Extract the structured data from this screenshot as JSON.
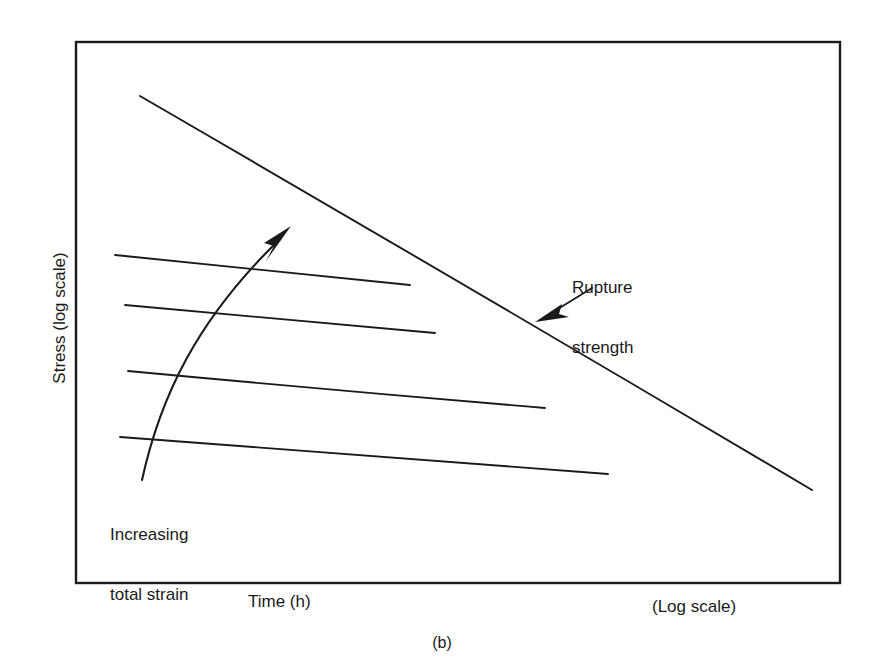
{
  "figure": {
    "caption": "(b)",
    "background_color": "#ffffff",
    "ink_color": "#1a1a1a"
  },
  "axes": {
    "y_label": "Stress (log scale)",
    "x_label": "Time (h)",
    "x_scale_note": "(Log scale)"
  },
  "annotations": {
    "rupture": {
      "line1": "Rupture",
      "line2": "strength"
    },
    "strain": {
      "line1": "Increasing",
      "line2": "total strain"
    }
  },
  "chart_data": {
    "type": "line",
    "title": "",
    "subtitle": "",
    "xlabel": "Time (h)",
    "ylabel": "Stress (log scale)",
    "x_scale": "log",
    "y_scale": "log",
    "grid": false,
    "legend": null,
    "axis_ticks": {
      "x": [],
      "y": []
    },
    "notes": [
      "Schematic creep / stress-rupture diagram: both axes logarithmic with no numeric tick labels.",
      "Four near-horizontal constant-total-strain (isostrain) curves drop gently to the right.",
      "A single steep descending curve is the rupture-strength locus.",
      "A curved arrow crossing the isostrain curves marks the direction of increasing total strain."
    ],
    "series": [
      {
        "name": "Isostrain curve 1 (lowest total strain)",
        "role": "isostrain",
        "points": [
          [
            115,
            255
          ],
          [
            262,
            270
          ],
          [
            410,
            285
          ]
        ]
      },
      {
        "name": "Isostrain curve 2",
        "role": "isostrain",
        "points": [
          [
            125,
            305
          ],
          [
            280,
            319
          ],
          [
            435,
            333
          ]
        ]
      },
      {
        "name": "Isostrain curve 3",
        "role": "isostrain",
        "points": [
          [
            128,
            371
          ],
          [
            336,
            390
          ],
          [
            545,
            408
          ]
        ]
      },
      {
        "name": "Isostrain curve 4 (highest total strain)",
        "role": "isostrain",
        "points": [
          [
            120,
            437
          ],
          [
            364,
            456
          ],
          [
            608,
            474
          ]
        ]
      },
      {
        "name": "Rupture strength",
        "role": "rupture",
        "points": [
          [
            140,
            96
          ],
          [
            476,
            292
          ],
          [
            812,
            490
          ]
        ]
      }
    ],
    "arrows": [
      {
        "name": "increasing-total-strain-arrow",
        "label": "Increasing total strain",
        "tail": [
          142,
          480
        ],
        "tip": [
          290,
          228
        ],
        "curved": true
      },
      {
        "name": "rupture-strength-leader",
        "label": "Rupture strength",
        "tail": [
          586,
          290
        ],
        "tip": [
          537,
          320
        ],
        "curved": false
      }
    ],
    "plot_frame": {
      "left": 76,
      "top": 42,
      "right": 840,
      "bottom": 583
    }
  }
}
